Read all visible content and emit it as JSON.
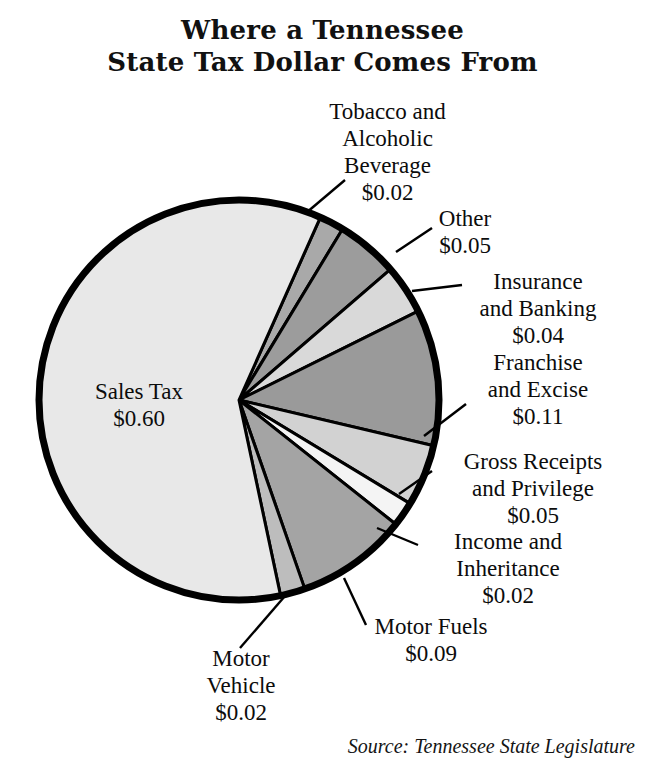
{
  "title": {
    "line1": "Where a Tennessee",
    "line2": "State Tax Dollar Comes From"
  },
  "source": "Source: Tennessee State Legislature",
  "labels": {
    "sales_tax": "Sales Tax\n$0.60",
    "tobacco": "Tobacco and\nAlcoholic\nBeverage\n$0.02",
    "other": "Other\n$0.05",
    "insurance": "Insurance\nand Banking\n$0.04",
    "franchise": "Franchise\nand Excise\n$0.11",
    "gross_receipts": "Gross Receipts\nand Privilege\n$0.05",
    "income": "Income and\nInheritance\n$0.02",
    "motor_fuels": "Motor Fuels\n$0.09",
    "motor_vehicle": "Motor\nVehicle\n$0.02"
  },
  "chart_data": {
    "type": "pie",
    "title": "Where a Tennessee State Tax Dollar Comes From",
    "subtitle": "",
    "xlabel": "",
    "ylabel": "",
    "units": "dollars per state tax dollar",
    "total": 1.0,
    "start_angle_deg": -66,
    "direction": "clockwise",
    "legend": "none (direct labels with leader lines)",
    "grid": false,
    "center_px": [
      239,
      400
    ],
    "radius_px": 200,
    "categories": [
      "Tobacco and Alcoholic Beverage",
      "Other",
      "Insurance and Banking",
      "Franchise and Excise",
      "Gross Receipts and Privilege",
      "Income and Inheritance",
      "Motor Fuels",
      "Motor Vehicle",
      "Sales Tax"
    ],
    "values": [
      0.02,
      0.05,
      0.04,
      0.11,
      0.05,
      0.02,
      0.09,
      0.02,
      0.6
    ],
    "value_labels": [
      "$0.02",
      "$0.05",
      "$0.04",
      "$0.11",
      "$0.05",
      "$0.02",
      "$0.09",
      "$0.02",
      "$0.60"
    ],
    "colors": [
      "#a9a9a9",
      "#9c9c9c",
      "#d9d9d9",
      "#9a9a9a",
      "#d2d2d2",
      "#f4f4f4",
      "#a4a4a4",
      "#bdbdbd",
      "#e8e8e8"
    ],
    "slices": [
      {
        "name": "Tobacco and Alcoholic Beverage",
        "value": 0.02,
        "label": "$0.02",
        "color": "#a9a9a9"
      },
      {
        "name": "Other",
        "value": 0.05,
        "label": "$0.05",
        "color": "#9c9c9c"
      },
      {
        "name": "Insurance and Banking",
        "value": 0.04,
        "label": "$0.04",
        "color": "#d9d9d9"
      },
      {
        "name": "Franchise and Excise",
        "value": 0.11,
        "label": "$0.11",
        "color": "#9a9a9a"
      },
      {
        "name": "Gross Receipts and Privilege",
        "value": 0.05,
        "label": "$0.05",
        "color": "#d2d2d2"
      },
      {
        "name": "Income and Inheritance",
        "value": 0.02,
        "label": "$0.02",
        "color": "#f4f4f4"
      },
      {
        "name": "Motor Fuels",
        "value": 0.09,
        "label": "$0.09",
        "color": "#a4a4a4"
      },
      {
        "name": "Motor Vehicle",
        "value": 0.02,
        "label": "$0.02",
        "color": "#bdbdbd"
      },
      {
        "name": "Sales Tax",
        "value": 0.6,
        "label": "$0.60",
        "color": "#e8e8e8"
      }
    ]
  }
}
